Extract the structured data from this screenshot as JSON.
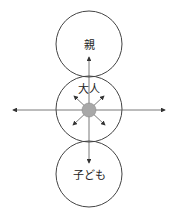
{
  "diagram": {
    "nodes": [
      {
        "id": "parent",
        "label": "親"
      },
      {
        "id": "adult",
        "label": "大人"
      },
      {
        "id": "child",
        "label": "子ども"
      }
    ],
    "colors": {
      "stroke": "#333333",
      "center_dot": "#a8a8a8"
    }
  }
}
